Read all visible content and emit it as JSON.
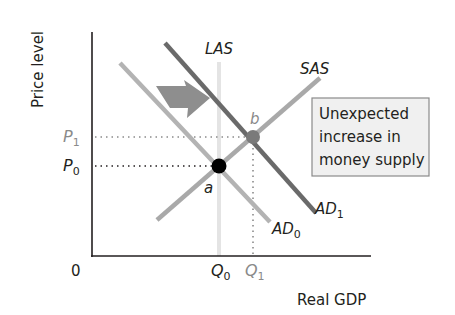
{
  "diagram": {
    "y_axis_label": "Price level",
    "x_axis_label": "Real GDP",
    "origin_label": "0",
    "curves": {
      "las": "LAS",
      "sas": "SAS",
      "ad0_base": "AD",
      "ad0_sub": "0",
      "ad1_base": "AD",
      "ad1_sub": "1"
    },
    "points": {
      "a": "a",
      "b": "b"
    },
    "price_ticks": {
      "p1_base": "P",
      "p1_sub": "1",
      "p0_base": "P",
      "p0_sub": "0"
    },
    "quantity_ticks": {
      "q0_base": "Q",
      "q0_sub": "0",
      "q1_base": "Q",
      "q1_sub": "1"
    },
    "annotation": {
      "line1": "Unexpected",
      "line2": "increase in",
      "line3": "money supply"
    },
    "colors": {
      "axis": "#231f20",
      "las": "#e4e4e4",
      "sas": "#a9a9a9",
      "ad0": "#b3b3b3",
      "ad1": "#6a6a6a",
      "arrow": "#8e8e8e",
      "point_a": "#000000",
      "point_b": "#7a7a7a",
      "box_fill": "#f0f0f0",
      "box_border": "#8a8a8a"
    }
  }
}
